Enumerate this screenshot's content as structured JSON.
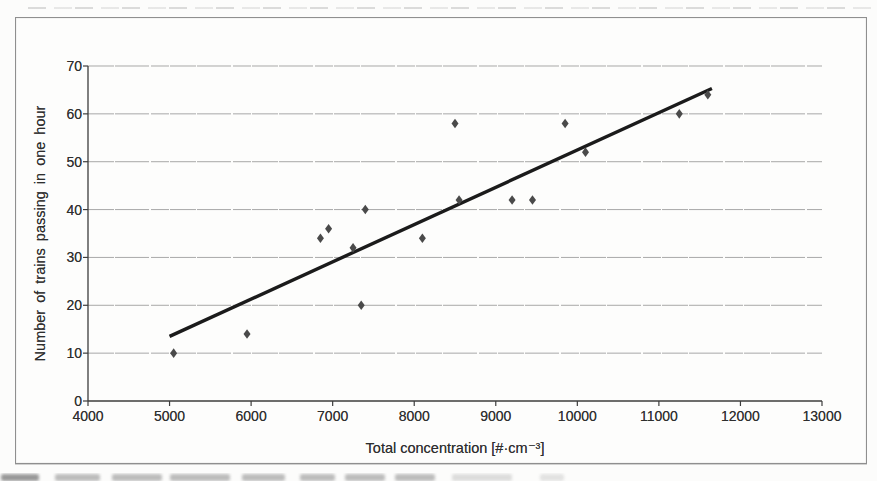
{
  "chart_data": {
    "type": "scatter",
    "title": "",
    "xlabel": "Total concentration [#·cm⁻³]",
    "ylabel": "Number of trains passing in one hour",
    "xlim": [
      4000,
      13000
    ],
    "ylim": [
      0,
      70
    ],
    "x_ticks": [
      "4000",
      "5000",
      "6000",
      "7000",
      "8000",
      "9000",
      "10000",
      "11000",
      "12000",
      "13000"
    ],
    "y_ticks": [
      "0",
      "10",
      "20",
      "30",
      "40",
      "50",
      "60",
      "70"
    ],
    "grid": "horizontal-only",
    "legend_position": "none",
    "marker": "diamond",
    "points": [
      {
        "x": 5050,
        "y": 10
      },
      {
        "x": 5950,
        "y": 14
      },
      {
        "x": 6850,
        "y": 34
      },
      {
        "x": 6950,
        "y": 36
      },
      {
        "x": 7250,
        "y": 32
      },
      {
        "x": 7350,
        "y": 20
      },
      {
        "x": 7400,
        "y": 40
      },
      {
        "x": 8100,
        "y": 34
      },
      {
        "x": 8500,
        "y": 58
      },
      {
        "x": 8550,
        "y": 42
      },
      {
        "x": 9200,
        "y": 42
      },
      {
        "x": 9450,
        "y": 42
      },
      {
        "x": 9850,
        "y": 58
      },
      {
        "x": 10100,
        "y": 52
      },
      {
        "x": 11250,
        "y": 60
      },
      {
        "x": 11600,
        "y": 64
      }
    ],
    "trendline": {
      "x1": 5000,
      "y1": 13.5,
      "x2": 11650,
      "y2": 65.3
    },
    "colors": {
      "marker": "#4a4a4a",
      "trendline": "#1b1b1b",
      "gridline": "#9e9e9e",
      "axis": "#3d3d3d",
      "frame_border": "#8f8f8f",
      "text": "#2e2e2e",
      "background": "#fdfdfc"
    }
  }
}
